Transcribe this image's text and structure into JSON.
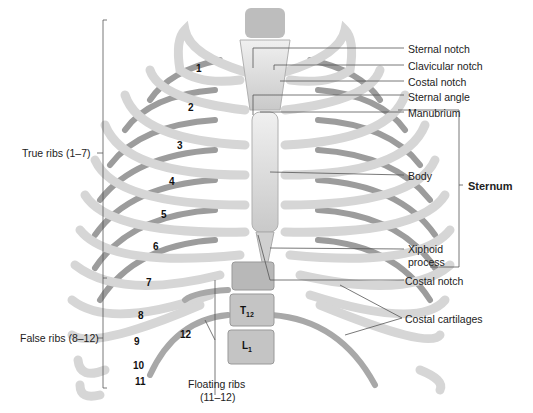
{
  "figure": {
    "colors": {
      "bone": "#dcdcdc",
      "bone_dark": "#9a9a9a",
      "line": "#555555",
      "background": "#ffffff"
    }
  },
  "left_labels": {
    "true_ribs": "True ribs (1–7)",
    "false_ribs": "False ribs (8–12)"
  },
  "right_labels": {
    "sternal_notch": "Sternal notch",
    "clavicular_notch": "Clavicular notch",
    "costal_notch_upper": "Costal notch",
    "sternal_angle": "Sternal angle",
    "manubrium": "Manubrium",
    "body": "Body",
    "xiphoid_1": "Xiphoid",
    "xiphoid_2": "process",
    "costal_notch_lower": "Costal notch",
    "costal_cartilages": "Costal cartilages",
    "sternum": "Sternum"
  },
  "bottom_labels": {
    "floating_1": "Floating ribs",
    "floating_2": "(11–12)"
  },
  "rib_numbers": [
    "1",
    "2",
    "3",
    "4",
    "5",
    "6",
    "7",
    "8",
    "9",
    "10",
    "11",
    "12"
  ],
  "vertebrae": {
    "t12": "T",
    "t12_sub": "12",
    "l1": "L",
    "l1_sub": "1"
  }
}
